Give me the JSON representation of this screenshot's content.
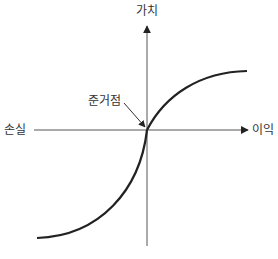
{
  "diagram": {
    "y_axis_label": "가치",
    "x_axis_negative_label": "손실",
    "x_axis_positive_label": "이익",
    "reference_point_label": "준거점",
    "colors": {
      "line": "#222222",
      "axis": "#444444",
      "background": "#ffffff"
    }
  }
}
